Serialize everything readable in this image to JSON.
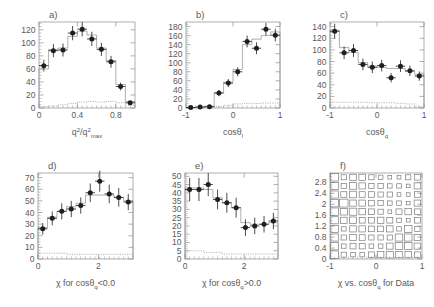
{
  "figure": {
    "title": "",
    "panel_count": 6
  },
  "chart_data": [
    {
      "type": "bar",
      "panel": "a)",
      "title": "a)",
      "xlabel": "q²/q²_max",
      "xlabel_parts": {
        "base1": "q",
        "sup1": "2",
        "slash": "/",
        "base2": "q",
        "sup2": "2",
        "sub2": "max"
      },
      "ylabel": "",
      "xlim": [
        0,
        1
      ],
      "ylim": [
        0,
        132
      ],
      "xticks": [
        0,
        0.4,
        0.8
      ],
      "xticklabels": [
        "0",
        "0.4",
        "0.8"
      ],
      "yticks": [
        0,
        20,
        40,
        60,
        80,
        100,
        120
      ],
      "yticklabels": [
        "0",
        "20",
        "40",
        "60",
        "80",
        "100",
        "120"
      ],
      "grid": false,
      "legend": "none",
      "x": [
        0.05,
        0.15,
        0.25,
        0.35,
        0.45,
        0.55,
        0.65,
        0.75,
        0.85,
        0.95
      ],
      "series": [
        {
          "name": "Data",
          "marker": "filled-circle",
          "values": [
            65,
            88,
            89,
            115,
            121,
            106,
            90,
            71,
            33,
            8
          ],
          "yerr": [
            9,
            10,
            10,
            11,
            11,
            11,
            10,
            9,
            6,
            3
          ],
          "xerr": [
            0.05,
            0.05,
            0.05,
            0.05,
            0.05,
            0.05,
            0.05,
            0.05,
            0.05,
            0.05
          ]
        },
        {
          "name": "MC total",
          "style": "solid-histogram",
          "values": [
            60,
            90,
            92,
            110,
            118,
            112,
            92,
            73,
            36,
            10
          ]
        },
        {
          "name": "Background",
          "style": "dotted-histogram",
          "values": [
            2,
            3,
            5,
            7,
            9,
            10,
            9,
            10,
            8,
            4
          ]
        }
      ]
    },
    {
      "type": "bar",
      "panel": "b)",
      "title": "b)",
      "xlabel": "cosθ_l",
      "xlabel_parts": {
        "base": "cosθ",
        "sub": "l"
      },
      "ylabel": "",
      "xlim": [
        -1,
        1
      ],
      "ylim": [
        0,
        190
      ],
      "xticks": [
        -1,
        0,
        1
      ],
      "xticklabels": [
        "-1",
        "0",
        "1"
      ],
      "yticks": [
        0,
        20,
        40,
        60,
        80,
        100,
        120,
        140,
        160,
        180
      ],
      "yticklabels": [
        "0",
        "20",
        "40",
        "60",
        "80",
        "100",
        "120",
        "140",
        "160",
        "180"
      ],
      "grid": false,
      "legend": "none",
      "x": [
        -0.9,
        -0.7,
        -0.5,
        -0.3,
        -0.1,
        0.1,
        0.3,
        0.5,
        0.7,
        0.9
      ],
      "series": [
        {
          "name": "Data",
          "marker": "filled-circle",
          "values": [
            1,
            2,
            3,
            33,
            55,
            80,
            147,
            132,
            174,
            161
          ],
          "yerr": [
            2,
            2,
            3,
            7,
            9,
            10,
            13,
            13,
            14,
            14
          ],
          "xerr": [
            0.1,
            0.1,
            0.1,
            0.1,
            0.1,
            0.1,
            0.1,
            0.1,
            0.1,
            0.1
          ]
        },
        {
          "name": "MC total",
          "style": "solid-histogram",
          "values": [
            1,
            2,
            4,
            34,
            57,
            85,
            140,
            152,
            160,
            168
          ]
        },
        {
          "name": "Background",
          "style": "dotted-histogram",
          "values": [
            0,
            0,
            1,
            3,
            6,
            9,
            10,
            10,
            11,
            11
          ]
        }
      ]
    },
    {
      "type": "bar",
      "panel": "c)",
      "title": "c)",
      "xlabel": "cosθ_q",
      "xlabel_parts": {
        "base": "cosθ",
        "sub": "q"
      },
      "ylabel": "",
      "xlim": [
        -1,
        1
      ],
      "ylim": [
        0,
        148
      ],
      "xticks": [
        -1,
        0,
        1
      ],
      "xticklabels": [
        "-1",
        "0",
        "1"
      ],
      "yticks": [
        0,
        20,
        40,
        60,
        80,
        100,
        120,
        140
      ],
      "yticklabels": [
        "0",
        "20",
        "40",
        "60",
        "80",
        "100",
        "120",
        "140"
      ],
      "grid": false,
      "legend": "none",
      "x": [
        -0.9,
        -0.7,
        -0.5,
        -0.3,
        -0.1,
        0.1,
        0.3,
        0.5,
        0.7,
        0.9
      ],
      "series": [
        {
          "name": "Data",
          "marker": "filled-circle",
          "values": [
            132,
            95,
            99,
            75,
            70,
            73,
            52,
            72,
            64,
            55
          ],
          "yerr": [
            13,
            11,
            11,
            10,
            10,
            10,
            8,
            10,
            9,
            8
          ],
          "xerr": [
            0.1,
            0.1,
            0.1,
            0.1,
            0.1,
            0.1,
            0.1,
            0.1,
            0.1,
            0.1
          ]
        },
        {
          "name": "MC total",
          "style": "solid-histogram",
          "values": [
            134,
            104,
            96,
            78,
            72,
            70,
            68,
            68,
            63,
            58
          ]
        },
        {
          "name": "Background",
          "style": "dotted-histogram",
          "values": [
            10,
            10,
            10,
            10,
            9,
            9,
            9,
            8,
            7,
            2
          ]
        }
      ]
    },
    {
      "type": "bar",
      "panel": "d)",
      "title": "d)",
      "xlabel": "χ for cosθ_q<0.0",
      "xlabel_parts": {
        "chi": "χ",
        "mid": " for cosθ",
        "sub": "q",
        "tail": "<0.0"
      },
      "ylabel": "",
      "xlim": [
        0,
        3.14159
      ],
      "ylim": [
        0,
        74
      ],
      "xticks": [
        0,
        2
      ],
      "xticklabels": [
        "0",
        "2"
      ],
      "yticks": [
        0,
        10,
        20,
        30,
        40,
        50,
        60,
        70
      ],
      "yticklabels": [
        "0",
        "10",
        "20",
        "30",
        "40",
        "50",
        "60",
        "70"
      ],
      "grid": false,
      "legend": "none",
      "x": [
        0.157,
        0.471,
        0.785,
        1.1,
        1.414,
        1.728,
        2.042,
        2.356,
        2.67,
        2.985
      ],
      "series": [
        {
          "name": "Data",
          "marker": "filled-circle",
          "values": [
            26,
            35,
            41,
            43,
            46,
            57,
            67,
            56,
            53,
            49
          ],
          "yerr": [
            5,
            6,
            7,
            7,
            7,
            8,
            9,
            8,
            8,
            7
          ],
          "xerr": [
            0.157,
            0.157,
            0.157,
            0.157,
            0.157,
            0.157,
            0.157,
            0.157,
            0.157,
            0.157
          ]
        },
        {
          "name": "MC total",
          "style": "solid-histogram",
          "values": [
            27,
            36,
            41,
            45,
            48,
            55,
            55,
            55,
            53,
            50
          ]
        },
        {
          "name": "Background",
          "style": "dotted-histogram",
          "values": [
            5,
            5,
            5,
            4,
            4,
            4,
            4,
            4,
            4,
            4
          ]
        }
      ]
    },
    {
      "type": "bar",
      "panel": "e)",
      "title": "e)",
      "xlabel": "χ for cosθ_q>0.0",
      "xlabel_parts": {
        "chi": "χ",
        "mid": " for cosθ",
        "sub": "q",
        "tail": ">0.0"
      },
      "ylabel": "",
      "xlim": [
        0,
        3.14159
      ],
      "ylim": [
        0,
        52
      ],
      "xticks": [
        0,
        2
      ],
      "xticklabels": [
        "0",
        "2"
      ],
      "yticks": [
        0,
        5,
        10,
        15,
        20,
        25,
        30,
        35,
        40,
        45,
        50
      ],
      "yticklabels": [
        "0",
        "5",
        "10",
        "15",
        "20",
        "25",
        "30",
        "35",
        "40",
        "45",
        "50"
      ],
      "grid": false,
      "legend": "none",
      "x": [
        0.157,
        0.471,
        0.785,
        1.1,
        1.414,
        1.728,
        2.042,
        2.356,
        2.67,
        2.985
      ],
      "series": [
        {
          "name": "Data",
          "marker": "filled-circle",
          "values": [
            42,
            42,
            45,
            36,
            34,
            31,
            19,
            20,
            21,
            23
          ],
          "yerr": [
            7,
            7,
            7,
            6,
            6,
            6,
            5,
            5,
            5,
            5
          ],
          "xerr": [
            0.157,
            0.157,
            0.157,
            0.157,
            0.157,
            0.157,
            0.157,
            0.157,
            0.157,
            0.157
          ]
        },
        {
          "name": "MC total",
          "style": "solid-histogram",
          "values": [
            43,
            43,
            42,
            37,
            34,
            31,
            22,
            21,
            21,
            22
          ]
        },
        {
          "name": "Background",
          "style": "dotted-histogram",
          "values": [
            5,
            5,
            4,
            4,
            3,
            3,
            3,
            3,
            3,
            3
          ]
        }
      ]
    },
    {
      "type": "heatmap",
      "panel": "f)",
      "title": "f)",
      "xlabel": "χ vs. cosθ_q for Data",
      "xlabel_parts": {
        "head": "χ vs. cosθ",
        "sub": "q",
        "tail": " for Data"
      },
      "ylabel": "",
      "style": "box-plot",
      "xlim": [
        -1,
        1
      ],
      "ylim": [
        0,
        3.14159
      ],
      "xticks": [
        -1,
        0,
        1
      ],
      "xticklabels": [
        "-1",
        "0",
        "1"
      ],
      "yticks": [
        0,
        0.4,
        0.8,
        1.2,
        1.6,
        2,
        2.4,
        2.8
      ],
      "yticklabels": [
        "0",
        "0.4",
        "0.8",
        "1.2",
        "1.6",
        "2",
        "2.4",
        "2.8"
      ],
      "grid": false,
      "legend": "none",
      "xcenters": [
        -0.9,
        -0.7,
        -0.5,
        -0.3,
        -0.1,
        0.1,
        0.3,
        0.5,
        0.7,
        0.9
      ],
      "ycenters": [
        0.157,
        0.471,
        0.785,
        1.1,
        1.414,
        1.728,
        2.042,
        2.356,
        2.67,
        2.985
      ],
      "z": [
        [
          9,
          4,
          3,
          3,
          5,
          6,
          7,
          6,
          6,
          5
        ],
        [
          9,
          3,
          5,
          5,
          3,
          3,
          6,
          8,
          8,
          6
        ],
        [
          8,
          4,
          6,
          5,
          4,
          4,
          4,
          8,
          8,
          6
        ],
        [
          8,
          3,
          6,
          6,
          5,
          5,
          6,
          3,
          8,
          4
        ],
        [
          8,
          6,
          7,
          5,
          5,
          6,
          5,
          3,
          2,
          5
        ],
        [
          9,
          7,
          8,
          6,
          5,
          4,
          2,
          5,
          6,
          5
        ],
        [
          9,
          10,
          6,
          6,
          5,
          4,
          3,
          3,
          2,
          6
        ],
        [
          8,
          5,
          7,
          5,
          5,
          4,
          4,
          2,
          2,
          5
        ],
        [
          8,
          4,
          7,
          6,
          4,
          4,
          3,
          3,
          2,
          6
        ],
        [
          9,
          4,
          6,
          6,
          4,
          3,
          2,
          2,
          4,
          5
        ]
      ]
    }
  ]
}
